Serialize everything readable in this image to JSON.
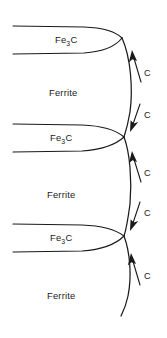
{
  "figure": {
    "background_color": "#ffffff",
    "line_color": "#1a1a1a",
    "width": 167,
    "height": 338
  },
  "phase_labels": [
    {
      "name": "cementite-1",
      "text_main": "Fe",
      "text_sub": "3",
      "text_tail": "C",
      "x": 68,
      "y": 43
    },
    {
      "name": "ferrite-1",
      "text": "Ferrite",
      "x": 68,
      "y": 93
    },
    {
      "name": "cementite-2",
      "text_main": "Fe",
      "text_sub": "3",
      "text_tail": "C",
      "x": 62,
      "y": 141
    },
    {
      "name": "ferrite-2",
      "text": "Ferrite",
      "x": 66,
      "y": 195
    },
    {
      "name": "cementite-3",
      "text_main": "Fe",
      "text_sub": "3",
      "text_tail": "C",
      "x": 62,
      "y": 241
    },
    {
      "name": "ferrite-3",
      "text": "Ferrite",
      "x": 66,
      "y": 296
    }
  ],
  "diffusion_arrows": [
    {
      "name": "carbon-arrow-up-1",
      "direction": "up",
      "label": "C",
      "label_x": 147,
      "label_y": 72
    },
    {
      "name": "carbon-arrow-down-1",
      "direction": "down",
      "label": "C",
      "label_x": 147,
      "label_y": 116
    },
    {
      "name": "carbon-arrow-up-2",
      "direction": "up",
      "label": "C",
      "label_x": 147,
      "label_y": 172
    },
    {
      "name": "carbon-arrow-down-2",
      "direction": "down",
      "label": "C",
      "label_x": 147,
      "label_y": 214
    },
    {
      "name": "carbon-arrow-up-3",
      "direction": "up",
      "label": "C",
      "label_x": 147,
      "label_y": 275
    }
  ],
  "lamella_bands": [
    {
      "name": "cementite-band-1",
      "top_y": 26,
      "bottom_y": 53,
      "phase": "Fe3C"
    },
    {
      "name": "cementite-band-2",
      "top_y": 124,
      "bottom_y": 151,
      "phase": "Fe3C"
    },
    {
      "name": "cementite-band-3",
      "top_y": 224,
      "bottom_y": 251,
      "phase": "Fe3C"
    }
  ]
}
